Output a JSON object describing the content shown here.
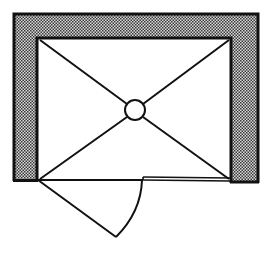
{
  "diagram": {
    "title": "Shower enclosure floor plan",
    "type": "architectural-plan-symbol",
    "elements": {
      "walls": {
        "fill_pattern": "stipple",
        "outline_color": "#111111",
        "fill_color": "#9a9a9a"
      },
      "shower_tray": {
        "diagonals": 2,
        "drain": "circle"
      },
      "door": {
        "type": "hinged-swing",
        "swing": "outward",
        "fixed_panel": true
      }
    },
    "colors": {
      "background": "#ffffff",
      "line": "#111111",
      "hatch_dark": "#2a2a2a",
      "hatch_light": "#d8d8d8"
    }
  }
}
